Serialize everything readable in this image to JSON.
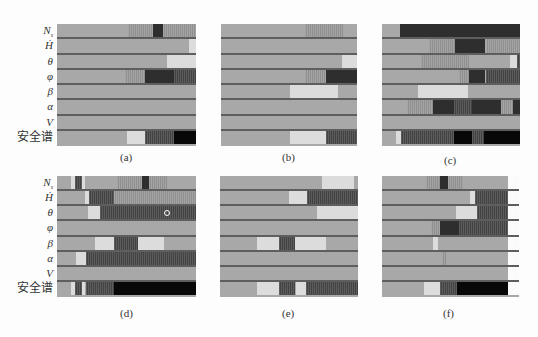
{
  "figure": {
    "row_labels": [
      "N_s",
      "Ḣ",
      "θ",
      "φ",
      "β",
      "α",
      "V",
      "安全谱"
    ],
    "row_label_display": [
      "N",
      "Ḣ",
      "θ",
      "φ",
      "β",
      "α",
      "V",
      "安全谱"
    ],
    "colors": {
      "base": "#a8a8a8",
      "light": "#dcdcdc",
      "stripe": "#9c9c9c",
      "darkstripe": "#585858",
      "dark": "#2e2e2e",
      "black": "#080808",
      "white": "#fbfbfb",
      "separator": "#5e5e5e"
    },
    "panels": [
      {
        "id": "a",
        "caption": "(a)",
        "x": 57,
        "y": 24,
        "w": 139,
        "h": 122,
        "cap_x": 120,
        "cap_y": 151,
        "rows": [
          [
            [
              0.51,
              0.69,
              "stripe"
            ],
            [
              0.69,
              0.76,
              "dark"
            ],
            [
              0.76,
              1.0,
              "stripe"
            ]
          ],
          [
            [
              0.95,
              1.0,
              "light"
            ]
          ],
          [
            [
              0.79,
              1.0,
              "light"
            ]
          ],
          [
            [
              0.49,
              0.63,
              "stripe"
            ],
            [
              0.63,
              0.84,
              "dark"
            ],
            [
              0.84,
              1.0,
              "darkstripe"
            ]
          ],
          [],
          [],
          [],
          [
            [
              0.5,
              0.63,
              "light"
            ],
            [
              0.63,
              0.84,
              "darkstripe"
            ],
            [
              0.84,
              1.0,
              "black"
            ]
          ]
        ]
      },
      {
        "id": "b",
        "caption": "(b)",
        "x": 221,
        "y": 24,
        "w": 136,
        "h": 122,
        "cap_x": 282,
        "cap_y": 151,
        "rows": [
          [
            [
              0.62,
              0.9,
              "stripe"
            ]
          ],
          [],
          [
            [
              0.89,
              1.0,
              "light"
            ]
          ],
          [
            [
              0.62,
              0.77,
              "stripe"
            ],
            [
              0.77,
              1.0,
              "dark"
            ]
          ],
          [
            [
              0.51,
              0.86,
              "light"
            ]
          ],
          [],
          [],
          [
            [
              0.51,
              0.77,
              "light"
            ],
            [
              0.77,
              1.0,
              "darkstripe"
            ]
          ]
        ]
      },
      {
        "id": "c",
        "caption": "(c)",
        "x": 382,
        "y": 24,
        "w": 138,
        "h": 122,
        "cap_x": 444,
        "cap_y": 154,
        "rows": [
          [
            [
              0.13,
              1.0,
              "dark"
            ]
          ],
          [
            [
              0.34,
              0.53,
              "stripe"
            ],
            [
              0.53,
              0.75,
              "dark"
            ],
            [
              0.75,
              1.0,
              "stripe"
            ]
          ],
          [
            [
              0.28,
              0.63,
              "stripe"
            ],
            [
              0.93,
              0.98,
              "light"
            ],
            [
              0.98,
              1.0,
              "darkstripe"
            ]
          ],
          [
            [
              0.56,
              0.63,
              "stripe"
            ],
            [
              0.63,
              0.75,
              "dark"
            ],
            [
              0.75,
              1.0,
              "darkstripe"
            ]
          ],
          [
            [
              0.26,
              0.62,
              "light"
            ]
          ],
          [
            [
              0.18,
              0.37,
              "stripe"
            ],
            [
              0.37,
              0.52,
              "dark"
            ],
            [
              0.52,
              0.65,
              "darkstripe"
            ],
            [
              0.65,
              0.86,
              "dark"
            ],
            [
              0.86,
              0.95,
              "stripe"
            ],
            [
              0.95,
              1.0,
              "dark"
            ]
          ],
          [],
          [
            [
              0.1,
              0.14,
              "light"
            ],
            [
              0.14,
              0.52,
              "darkstripe"
            ],
            [
              0.52,
              0.65,
              "black"
            ],
            [
              0.65,
              0.74,
              "darkstripe"
            ],
            [
              0.74,
              1.0,
              "black"
            ]
          ]
        ]
      },
      {
        "id": "d",
        "caption": "(d)",
        "x": 57,
        "y": 176,
        "w": 139,
        "h": 121,
        "cap_x": 120,
        "cap_y": 307,
        "rows": [
          [
            [
              0.1,
              0.13,
              "light"
            ],
            [
              0.13,
              0.18,
              "darkstripe"
            ],
            [
              0.18,
              0.2,
              "light"
            ],
            [
              0.43,
              0.61,
              "stripe"
            ],
            [
              0.61,
              0.66,
              "dark"
            ],
            [
              0.66,
              0.79,
              "stripe"
            ]
          ],
          [
            [
              0.2,
              0.23,
              "light"
            ],
            [
              0.23,
              0.41,
              "darkstripe"
            ],
            [
              0.41,
              1.0,
              "stripe"
            ]
          ],
          [
            [
              0.22,
              0.31,
              "light"
            ],
            [
              0.31,
              1.0,
              "darkstripe"
            ]
          ],
          [],
          [
            [
              0.27,
              0.41,
              "light"
            ],
            [
              0.41,
              0.58,
              "darkstripe"
            ],
            [
              0.58,
              0.77,
              "light"
            ]
          ],
          [
            [
              0.14,
              0.21,
              "light"
            ],
            [
              0.21,
              1.0,
              "darkstripe"
            ]
          ],
          [],
          [
            [
              0.1,
              0.13,
              "light"
            ],
            [
              0.13,
              0.18,
              "darkstripe"
            ],
            [
              0.18,
              0.2,
              "light"
            ],
            [
              0.21,
              0.41,
              "darkstripe"
            ],
            [
              0.41,
              1.0,
              "black"
            ]
          ]
        ]
      },
      {
        "id": "e",
        "caption": "(e)",
        "x": 220,
        "y": 176,
        "w": 138,
        "h": 121,
        "cap_x": 282,
        "cap_y": 307,
        "rows": [
          [
            [
              0.74,
              0.97,
              "light"
            ]
          ],
          [
            [
              0.5,
              0.63,
              "light"
            ],
            [
              0.63,
              1.0,
              "darkstripe"
            ]
          ],
          [
            [
              0.7,
              1.0,
              "light"
            ]
          ],
          [],
          [
            [
              0.27,
              0.43,
              "light"
            ],
            [
              0.43,
              0.54,
              "darkstripe"
            ],
            [
              0.54,
              0.77,
              "light"
            ]
          ],
          [],
          [],
          [
            [
              0.27,
              0.43,
              "light"
            ],
            [
              0.43,
              0.54,
              "darkstripe"
            ],
            [
              0.55,
              0.62,
              "light"
            ],
            [
              0.62,
              1.0,
              "darkstripe"
            ]
          ]
        ]
      },
      {
        "id": "f",
        "caption": "(f)",
        "x": 382,
        "y": 176,
        "w": 137,
        "h": 121,
        "cap_x": 443,
        "cap_y": 307,
        "white_from": 0.92,
        "rows": [
          [
            [
              0.32,
              0.42,
              "stripe"
            ],
            [
              0.42,
              0.48,
              "dark"
            ],
            [
              0.48,
              0.59,
              "stripe"
            ]
          ],
          [
            [
              0.64,
              0.68,
              "light"
            ],
            [
              0.68,
              0.92,
              "darkstripe"
            ]
          ],
          [
            [
              0.54,
              0.69,
              "light"
            ],
            [
              0.69,
              0.92,
              "darkstripe"
            ]
          ],
          [
            [
              0.36,
              0.42,
              "stripe"
            ],
            [
              0.42,
              0.56,
              "dark"
            ],
            [
              0.56,
              0.92,
              "darkstripe"
            ]
          ],
          [
            [
              0.37,
              0.41,
              "light"
            ]
          ],
          [
            [
              0.44,
              0.47,
              "stripe"
            ]
          ],
          [],
          [
            [
              0.31,
              0.42,
              "light"
            ],
            [
              0.42,
              0.55,
              "darkstripe"
            ],
            [
              0.55,
              0.92,
              "black"
            ]
          ]
        ]
      }
    ],
    "marker": {
      "panel": "d",
      "row": 2,
      "pos": 0.79
    }
  }
}
